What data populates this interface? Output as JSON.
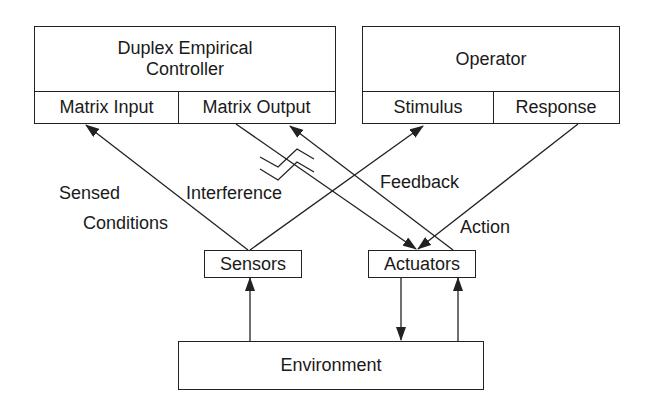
{
  "controller": {
    "title_line1": "Duplex Empirical",
    "title_line2": "Controller",
    "ports": [
      "Matrix Input",
      "Matrix Output"
    ]
  },
  "operator": {
    "title": "Operator",
    "ports": [
      "Stimulus",
      "Response"
    ]
  },
  "sensors": {
    "label": "Sensors"
  },
  "actuators": {
    "label": "Actuators"
  },
  "environment": {
    "label": "Environment"
  },
  "edge_labels": {
    "sensed_line1": "Sensed",
    "sensed_line2": "Conditions",
    "interference": "Interference",
    "feedback": "Feedback",
    "action": "Action"
  },
  "colors": {
    "stroke": "#222222",
    "background": "#ffffff"
  }
}
